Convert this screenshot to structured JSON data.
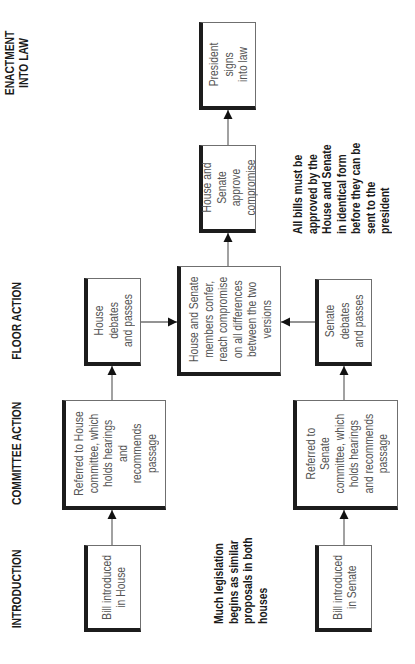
{
  "diagram": {
    "type": "flowchart",
    "orientation": "rotated-90-ccw",
    "stages": [
      {
        "id": "introduction",
        "label": "INTRODUCTION"
      },
      {
        "id": "committee",
        "label": "COMMITTEE ACTION"
      },
      {
        "id": "floor",
        "label": "FLOOR ACTION"
      },
      {
        "id": "enactment",
        "label_line1": "ENACTMENT",
        "label_line2": "INTO LAW"
      }
    ],
    "nodes": {
      "bill_house": {
        "lines": [
          "Bill introduced",
          "in House"
        ]
      },
      "bill_senate": {
        "lines": [
          "Bill introduced",
          "in Senate"
        ]
      },
      "committee_house": {
        "lines": [
          "Referred to House",
          "committee, which",
          "holds hearings and",
          "recommends",
          "passage"
        ]
      },
      "committee_senate": {
        "lines": [
          "Referred to",
          "Senate",
          "committee, which",
          "holds hearings",
          "and recommends",
          "passage"
        ]
      },
      "floor_house": {
        "lines": [
          "House debates",
          "and passes"
        ]
      },
      "floor_senate": {
        "lines": [
          "Senate debates",
          "and passes"
        ]
      },
      "conference": {
        "lines": [
          "House and Senate",
          "members confer,",
          "reach compromise",
          "on all differences",
          "between the two",
          "versions"
        ]
      },
      "approve": {
        "lines": [
          "House and",
          "Senate approve",
          "compromise"
        ]
      },
      "president": {
        "lines": [
          "President signs",
          "into law"
        ]
      }
    },
    "edges": [
      {
        "from": "bill_house",
        "to": "committee_house"
      },
      {
        "from": "committee_house",
        "to": "floor_house"
      },
      {
        "from": "floor_house",
        "to": "conference"
      },
      {
        "from": "bill_senate",
        "to": "committee_senate"
      },
      {
        "from": "committee_senate",
        "to": "floor_senate"
      },
      {
        "from": "floor_senate",
        "to": "conference"
      },
      {
        "from": "conference",
        "to": "approve"
      },
      {
        "from": "approve",
        "to": "president"
      }
    ],
    "notes": {
      "introduction_note": {
        "lines": [
          "Much legislation",
          "begins as similar",
          "proposals in both",
          "houses"
        ]
      },
      "approval_note": {
        "lines": [
          "All bills must be",
          "approved by the",
          "House and Senate",
          "in identical form",
          "before they can be",
          "sent to the",
          "president"
        ]
      }
    },
    "colors": {
      "box_border_thick": "#1c1c1c",
      "box_border_thin": "#6f6f6f",
      "box_text": "#555555",
      "heading_text": "#1a1a1a",
      "connector": "#6f6f6f",
      "arrowhead": "#111111",
      "background": "#ffffff"
    }
  }
}
